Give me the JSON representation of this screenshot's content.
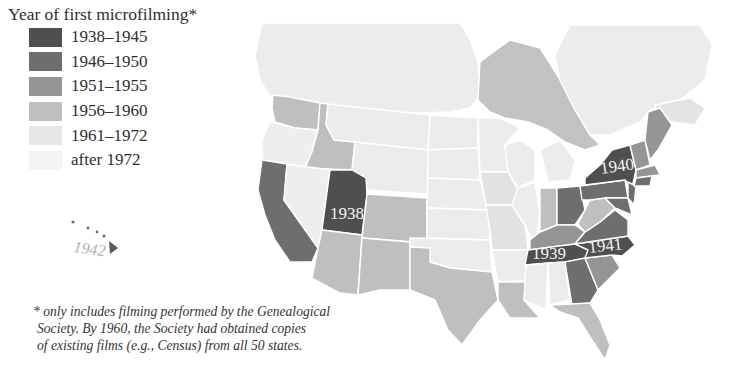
{
  "legend": {
    "title": "Year of first microfilming*",
    "items": [
      {
        "label": "1938–1945",
        "color": "#4f4f4f"
      },
      {
        "label": "1946–1950",
        "color": "#6e6e6e"
      },
      {
        "label": "1951–1955",
        "color": "#959595"
      },
      {
        "label": "1956–1960",
        "color": "#bfbfbf"
      },
      {
        "label": "1961–1972",
        "color": "#e6e6e6"
      },
      {
        "label": "after 1972",
        "color": "#f4f4f4"
      }
    ]
  },
  "map": {
    "region": "United States and southern Canada",
    "canada_color": "#ececec",
    "ontario_color": "#c2c2c2",
    "labels": {
      "utah": "1938",
      "new_york": "1940",
      "tennessee": "1939",
      "north_carolina": "1941",
      "hawaii": "1942"
    },
    "state_categories": {
      "Utah": "1938–1945",
      "New York": "1938–1945",
      "Pennsylvania": "1946–1950",
      "Tennessee": "1938–1945",
      "North Carolina": "1938–1945",
      "Virginia": "1946–1950",
      "Maryland": "1946–1950",
      "Hawaii": "1938–1945",
      "California": "1946–1950",
      "Ohio": "1946–1950",
      "Georgia": "1946–1950",
      "Connecticut": "1946–1950",
      "Maine": "1951–1955",
      "Vermont": "1951–1955",
      "New Hampshire": "1951–1955",
      "Massachusetts": "1951–1955",
      "Kentucky": "1951–1955",
      "South Carolina": "1951–1955",
      "West Virginia": "1956–1960",
      "Indiana": "1956–1960",
      "Washington": "1956–1960",
      "Idaho": "1956–1960",
      "Colorado": "1956–1960",
      "Arizona": "1956–1960",
      "New Mexico": "1956–1960",
      "Texas": "1956–1960",
      "Louisiana": "1956–1960",
      "Florida": "1956–1960",
      "Iowa": "1956–1960",
      "Missouri": "1956–1960",
      "Oregon": "1961–1972",
      "Nevada": "1961–1972",
      "Montana": "1961–1972",
      "Wyoming": "1961–1972",
      "North Dakota": "1961–1972",
      "South Dakota": "1961–1972",
      "Nebraska": "1961–1972",
      "Kansas": "1961–1972",
      "Oklahoma": "1961–1972",
      "Minnesota": "1961–1972",
      "Wisconsin": "1961–1972",
      "Illinois": "1961–1972",
      "Michigan": "1961–1972",
      "Arkansas": "1961–1972",
      "Mississippi": "1961–1972",
      "Alabama": "1961–1972"
    }
  },
  "footnote": {
    "lines": [
      "* only includes filming performed by the Genealogical",
      "Society.  By 1960, the Society had obtained copies",
      "of existing films (e.g., Census) from all 50 states."
    ]
  }
}
